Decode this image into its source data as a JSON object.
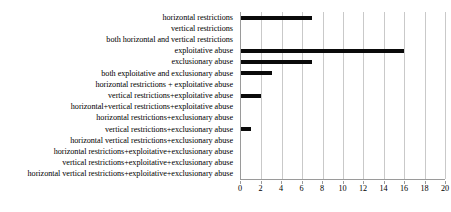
{
  "chart_data": {
    "type": "bar",
    "orientation": "horizontal",
    "title": "",
    "xlabel": "",
    "ylabel": "",
    "xlim": [
      0,
      20
    ],
    "xticks": [
      0,
      2,
      4,
      6,
      8,
      10,
      12,
      14,
      16,
      18,
      20
    ],
    "grid": "vertical",
    "legend": "none",
    "bar_color": "#0a0a0a",
    "gridline_color": "#c9c9c9",
    "axis_color": "#9a9a9a",
    "categories": [
      "horizontal restrictions",
      "vertical restrictions",
      "both horizontal and vertical restrictions",
      "exploitative abuse",
      "exclusionary abuse",
      "both exploitative and exclusionary abuse",
      "horizontal restrictions + exploitative abuse",
      "vertical restrictions+exploitative abuse",
      "horizontal+vertical restrictions+exploitative abuse",
      "horizontal restrictions+exclusionary abuse",
      "vertical restrictions+exclusionary abuse",
      "horizontal vertical restrictions+exclusionary abuse",
      "horizontal restrictions+exploitative+exclusionary abuse",
      "vertical restrictions+exploitative+exclusionary abuse",
      "horizontal vertical restrictions+exploitative+exclusionary abuse"
    ],
    "values": [
      7,
      0,
      0,
      16,
      7,
      3,
      0,
      2,
      0,
      0,
      1,
      0,
      0,
      0,
      0
    ]
  }
}
